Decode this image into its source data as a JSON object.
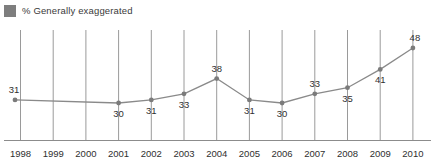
{
  "legend": {
    "swatch_color": "#7e7e7e",
    "label": "% Generally exaggerated"
  },
  "axis": {
    "line_color": "#8c8c8c",
    "grid_color": "#9a9a9a"
  },
  "series_style": {
    "line_color": "#8a8a8a",
    "marker_color": "#7b7b7b"
  },
  "chart_data": {
    "type": "line",
    "title": "",
    "subtitle": "",
    "xlabel": "",
    "ylabel": "",
    "grid": "vertical-only",
    "legend_position": "top-left",
    "xlim": [
      1998,
      2010
    ],
    "ylim": [
      26,
      52
    ],
    "categories": [
      "1998",
      "1999",
      "2000",
      "2001",
      "2002",
      "2003",
      "2004",
      "2005",
      "2006",
      "2007",
      "2008",
      "2009",
      "2010"
    ],
    "tick_labels": [
      "1998",
      "1999",
      "2000",
      "2001",
      "2002",
      "2003",
      "2004",
      "2005",
      "2006",
      "2007",
      "2008",
      "2009",
      "2010"
    ],
    "series": [
      {
        "name": "% Generally exaggerated",
        "values": [
          31,
          null,
          null,
          30,
          31,
          33,
          38,
          31,
          30,
          33,
          35,
          41,
          48
        ],
        "point_labels": [
          "31",
          "",
          "",
          "30",
          "31",
          "33",
          "38",
          "31",
          "30",
          "33",
          "35",
          "41",
          "48"
        ],
        "label_positions": [
          "above",
          "",
          "",
          "below",
          "below",
          "below",
          "above",
          "below",
          "below",
          "above",
          "below",
          "below",
          "above"
        ],
        "markers": [
          true,
          false,
          false,
          true,
          true,
          true,
          true,
          true,
          true,
          true,
          true,
          true,
          true
        ]
      }
    ]
  }
}
